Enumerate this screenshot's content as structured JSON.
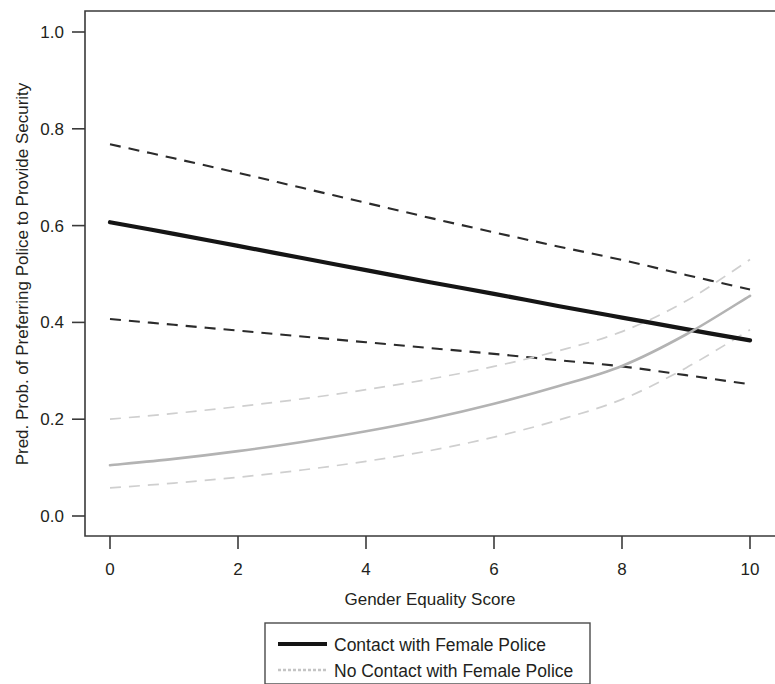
{
  "chart_data": {
    "type": "line",
    "title": "",
    "xlabel": "Gender Equality Score",
    "ylabel": "Pred. Prob. of Preferring Police to Provide Security",
    "xlim": [
      0,
      10
    ],
    "ylim": [
      0.0,
      1.0
    ],
    "grid": false,
    "legend_position": "bottom",
    "x_ticks": [
      0,
      2,
      4,
      6,
      8,
      10
    ],
    "x_tick_labels": [
      "0",
      "2",
      "4",
      "6",
      "8",
      "10"
    ],
    "y_ticks": [
      0.0,
      0.2,
      0.4,
      0.6,
      0.8,
      1.0
    ],
    "y_tick_labels": [
      "0.0",
      "0.2",
      "0.4",
      "0.6",
      "0.8",
      "1.0"
    ],
    "x": [
      0,
      1,
      2,
      3,
      4,
      5,
      6,
      7,
      8,
      9,
      10
    ],
    "series": [
      {
        "name": "Contact with Female Police",
        "style": "solid",
        "color": "#151515",
        "values": [
          0.607,
          0.583,
          0.558,
          0.533,
          0.508,
          0.483,
          0.459,
          0.434,
          0.41,
          0.386,
          0.363
        ],
        "ci_upper": [
          0.768,
          0.739,
          0.709,
          0.678,
          0.647,
          0.616,
          0.586,
          0.557,
          0.529,
          0.498,
          0.468
        ],
        "ci_lower": [
          0.407,
          0.395,
          0.383,
          0.371,
          0.359,
          0.347,
          0.335,
          0.322,
          0.309,
          0.291,
          0.272
        ]
      },
      {
        "name": "No Contact with Female Police",
        "style": "solid",
        "color": "#b3b3b3",
        "values": [
          0.105,
          0.118,
          0.134,
          0.153,
          0.175,
          0.201,
          0.232,
          0.268,
          0.31,
          0.375,
          0.455
        ],
        "ci_upper": [
          0.2,
          0.212,
          0.226,
          0.242,
          0.261,
          0.283,
          0.309,
          0.341,
          0.381,
          0.444,
          0.53
        ],
        "ci_lower": [
          0.058,
          0.068,
          0.08,
          0.095,
          0.113,
          0.135,
          0.163,
          0.198,
          0.241,
          0.306,
          0.385
        ]
      }
    ],
    "legend_entries": [
      {
        "label": "Contact with Female Police",
        "swatch": "solid-black-line"
      },
      {
        "label": "No Contact with Female Police",
        "swatch": "light-gray-line"
      }
    ]
  }
}
